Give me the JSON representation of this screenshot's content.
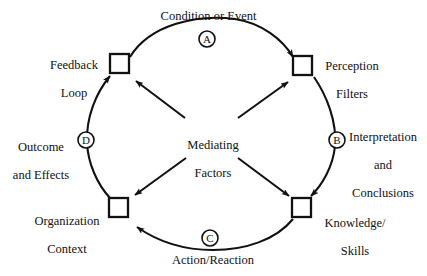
{
  "diagram": {
    "type": "cycle-diagram",
    "stroke_color": "#111111",
    "background_color": "#ffffff",
    "center": {
      "label_line1": "Mediating",
      "label_line2": "Factors"
    },
    "nodes": [
      {
        "id": "feedback-loop",
        "label_line1": "Feedback",
        "label_line2": "Loop",
        "position": "top-left"
      },
      {
        "id": "perception-filters",
        "label_line1": "Perception",
        "label_line2": "Filters",
        "position": "top-right"
      },
      {
        "id": "knowledge-skills",
        "label_line1": "Knowledge/",
        "label_line2": "Skills",
        "position": "bottom-right"
      },
      {
        "id": "organization-context",
        "label_line1": "Organization",
        "label_line2": "Context",
        "position": "bottom-left"
      }
    ],
    "arcs": [
      {
        "id": "arc-a",
        "marker": "A",
        "label": "Condition or Event",
        "from": "feedback-loop",
        "to": "perception-filters",
        "label_position": "top"
      },
      {
        "id": "arc-b",
        "marker": "B",
        "label_line1": "Interpretation",
        "label_line2": "and",
        "label_line3": "Conclusions",
        "from": "perception-filters",
        "to": "knowledge-skills",
        "label_position": "right"
      },
      {
        "id": "arc-c",
        "marker": "C",
        "label": "Action/Reaction",
        "from": "knowledge-skills",
        "to": "organization-context",
        "label_position": "bottom"
      },
      {
        "id": "arc-d",
        "marker": "D",
        "label_line1": "Outcome",
        "label_line2": "and Effects",
        "from": "organization-context",
        "to": "feedback-loop",
        "label_position": "left"
      }
    ]
  }
}
